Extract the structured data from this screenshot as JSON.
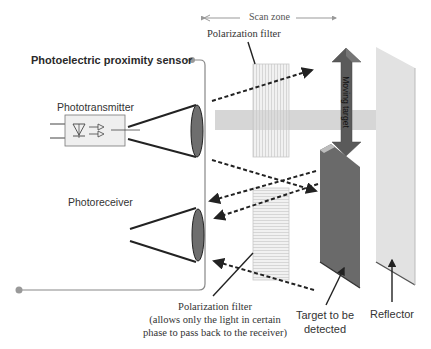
{
  "diagram": {
    "title": "Photoelectric proximity sensor",
    "scan_zone_label": "Scan zone",
    "labels": {
      "phototransmitter": "Phototransmitter",
      "photoreceiver": "Photoreceiver",
      "polarization_filter_top": "Polarization filter",
      "polarization_filter_bottom_line1": "Polarization filter",
      "polarization_filter_bottom_line2": "(allows only the light in certain",
      "polarization_filter_bottom_line3": "phase to pass back to the receiver)",
      "moving_target": "Moving target",
      "target_line1": "Target to be",
      "target_line2": "detected",
      "reflector": "Reflector"
    },
    "colors": {
      "lens": "#6e6e6e",
      "target_arrow": "#5a5a5a",
      "target_panel": "#6a6a6a",
      "reflector_panel": "#e2e2e2",
      "light_band": "#d6d6d6",
      "housing_line": "#888888"
    }
  }
}
